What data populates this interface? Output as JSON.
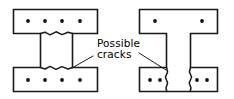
{
  "figure": {
    "background_color": "#ffffff",
    "line_color": "#1a1a1a",
    "rebar_color": "#111111",
    "width": 234,
    "height": 99
  },
  "annotation": {
    "line1": "Possible",
    "line2": "cracks",
    "full_text": "Possible cracks",
    "text_x": 97,
    "text_y1": 47,
    "text_y2": 58,
    "leaders": [
      {
        "name": "leader-to-left-beam",
        "from_x": 93,
        "from_y": 56,
        "to_x": 72,
        "to_y": 68
      },
      {
        "name": "leader-to-right-beam",
        "from_x": 139,
        "from_y": 53,
        "to_x": 166,
        "to_y": 70
      }
    ]
  },
  "left_beam": {
    "name": "I-beam-cross-section",
    "outline_path": "M 13.5 9.5 L 97.5 9.5 L 97.5 33.5 L 72.5 33.5 L 72.5 67.5 L 97.5 67.5 L 97.5 91.5 L 13.5 91.5 L 13.5 67.5 L 40.5 67.5 L 40.5 33.5 L 13.5 33.5 Z",
    "top_flange_rebar_count": 4,
    "bottom_flange_rebar_count": 4,
    "top_flange_rebar": [
      {
        "cx": 28,
        "cy": 21,
        "r": 1.9
      },
      {
        "cx": 45,
        "cy": 21,
        "r": 1.9
      },
      {
        "cx": 62,
        "cy": 21,
        "r": 1.9
      },
      {
        "cx": 80,
        "cy": 21,
        "r": 1.9
      }
    ],
    "bottom_flange_rebar": [
      {
        "cx": 28,
        "cy": 80,
        "r": 1.9
      },
      {
        "cx": 45,
        "cy": 80,
        "r": 1.9
      },
      {
        "cx": 62,
        "cy": 80,
        "r": 1.9
      },
      {
        "cx": 80,
        "cy": 80,
        "r": 1.9
      }
    ],
    "cracks": [
      {
        "name": "crack-top-web-junction",
        "path": "M 40.5 33.5 L 45 32.2 L 50 34.8 L 56 31.8 L 62 34.6 L 68 32.2 L 72.5 33.5"
      },
      {
        "name": "crack-bottom-web-junction",
        "path": "M 40.5 67.5 L 45 69.0 L 50 66.4 L 56 69.4 L 62 66.6 L 68 69.0 L 72.5 67.5"
      }
    ]
  },
  "right_beam": {
    "name": "T-beam-cross-section",
    "outline_path": "M 139.5 9.5 L 217.5 9.5 L 217.5 33.5 L 190.5 33.5 L 190.5 67.5 L 217.5 67.5 L 217.5 91.5 L 139.5 91.5 L 139.5 67.5 L 166.5 67.5 L 166.5 33.5 L 139.5 33.5 Z",
    "top_flange_rebar_count": 2,
    "bottom_flange_rebar_count": 4,
    "top_flange_rebar": [
      {
        "cx": 155,
        "cy": 21,
        "r": 1.9
      },
      {
        "cx": 202,
        "cy": 21,
        "r": 1.9
      }
    ],
    "bottom_flange_rebar": [
      {
        "cx": 150,
        "cy": 80,
        "r": 1.9
      },
      {
        "cx": 160,
        "cy": 80,
        "r": 1.9
      },
      {
        "cx": 197,
        "cy": 80,
        "r": 1.9
      },
      {
        "cx": 207,
        "cy": 80,
        "r": 1.9
      }
    ],
    "cracks": [
      {
        "name": "crack-left-web-vertical",
        "path": "M 166.5 67.5 L 167.6 72 L 165.4 77 L 167.6 83 L 166.0 88 L 166.8 91.5"
      },
      {
        "name": "crack-right-web-vertical",
        "path": "M 190.5 67.5 L 189.4 72 L 191.6 77 L 189.2 83 L 191.0 88 L 190.2 91.5"
      }
    ]
  }
}
